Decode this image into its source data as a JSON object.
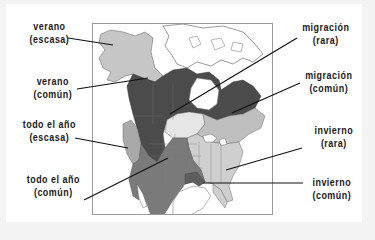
{
  "map": {
    "subject": "Range map of North America",
    "colors": {
      "background": "#f3f3f3",
      "card": "#ffffff",
      "water": "#ffffff",
      "summer_scarce": "#c6c6c6",
      "summer_common": "#4b4b4b",
      "year_round_scarce": "#a9a9a9",
      "year_round_common": "#7a7a7a",
      "migration_rare": "#e6e6e6",
      "migration_common": "#bfbfbf",
      "winter_rare": "#cfcfcf",
      "winter_common": "#8d8d8d",
      "borders": "#6e6e6e",
      "leader_line": "#111111"
    }
  },
  "legend": {
    "summer_scarce": {
      "line1": "verano",
      "line2": "(escasa)"
    },
    "summer_common": {
      "line1": "verano",
      "line2": "(común)"
    },
    "year_round_scarce": {
      "line1": "todo el año",
      "line2": "(escasa)"
    },
    "year_round_common": {
      "line1": "todo el año",
      "line2": "(común)"
    },
    "migration_rare": {
      "line1": "migración",
      "line2": "(rara)"
    },
    "migration_common": {
      "line1": "migración",
      "line2": "(común)"
    },
    "winter_rare": {
      "line1": "invierno",
      "line2": "(rara)"
    },
    "winter_common": {
      "line1": "invierno",
      "line2": "(común)"
    }
  }
}
